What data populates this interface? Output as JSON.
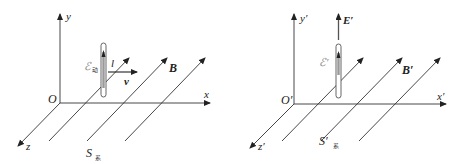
{
  "left_panel": {
    "frame_label": "S",
    "frame_subscript": "系",
    "origin_label": "O",
    "x_label": "x",
    "y_label": "y",
    "z_label": "z",
    "field_label": "B",
    "rod_length_label": "l",
    "velocity_label": "v",
    "emf_label": "ℰ",
    "emf_subscript": "动"
  },
  "right_panel": {
    "frame_label": "S′",
    "frame_subscript": "系",
    "origin_label": "O′",
    "x_label": "x′",
    "y_label": "y′",
    "z_label": "z′",
    "field_label": "B′",
    "electric_field_label": "E′",
    "emf_label": "ℰ′"
  },
  "colors": {
    "line": "#333333",
    "rod_outline": "#555555",
    "rod_fill": "#bbbbbb"
  }
}
